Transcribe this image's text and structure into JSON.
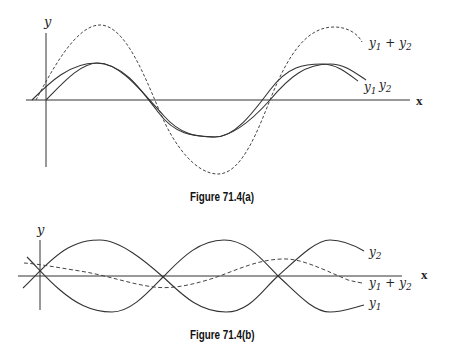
{
  "figures": [
    {
      "id": "a",
      "caption": "Figure 71.4(a)",
      "axes": {
        "y_label": "y",
        "x_label": "x"
      },
      "curves": [
        {
          "name": "y1",
          "label": "y₁",
          "style": "solid",
          "amplitude": 1.0,
          "phase": "leads"
        },
        {
          "name": "y2",
          "label": "y₂",
          "style": "solid",
          "amplitude": 1.0,
          "phase": "lags slightly"
        },
        {
          "name": "y1+y2",
          "label": "y₁ + y₂",
          "style": "dashed",
          "amplitude": 2.0,
          "note": "constructive interference"
        }
      ]
    },
    {
      "id": "b",
      "caption": "Figure 71.4(b)",
      "axes": {
        "y_label": "y",
        "x_label": "x"
      },
      "curves": [
        {
          "name": "y2",
          "label": "y₂",
          "style": "solid",
          "amplitude": 1.0
        },
        {
          "name": "y1+y2",
          "label": "y₁ + y₂",
          "style": "dashed",
          "amplitude": 0.25,
          "note": "destructive interference"
        },
        {
          "name": "y1",
          "label": "y₁",
          "style": "solid",
          "amplitude": 1.0
        }
      ]
    }
  ],
  "labels": {
    "a_y": "y",
    "a_x": "x",
    "a_sum_base": "y",
    "a_sum_sub1": "1",
    "a_sum_plus": " + ",
    "a_sum_base2": "y",
    "a_sum_sub2": "2",
    "a_y1_base": "y",
    "a_y1_sub": "1",
    "a_y2_base": "y",
    "a_y2_sub": "2",
    "b_y": "y",
    "b_x": "x",
    "b_y2_base": "y",
    "b_y2_sub": "2",
    "b_sum_base": "y",
    "b_sum_sub1": "1",
    "b_sum_plus": " + ",
    "b_sum_base2": "y",
    "b_sum_sub2": "2",
    "b_y1_base": "y",
    "b_y1_sub": "1"
  }
}
